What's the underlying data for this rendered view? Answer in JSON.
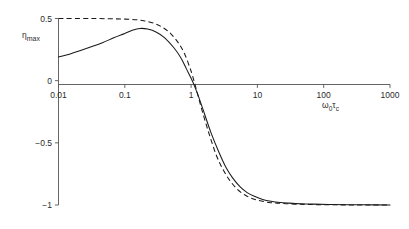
{
  "chart_data": {
    "type": "line",
    "title": "",
    "subtitle": "",
    "xlabel": "ω₀τc",
    "xlabel_main": "ω",
    "xlabel_sub1": "0",
    "xlabel_mid": "τ",
    "xlabel_sub2": "c",
    "ylabel": "ηmax",
    "ylabel_main": "η",
    "ylabel_sub": "max",
    "xscale": "log",
    "yscale": "linear",
    "xlim": [
      0.01,
      1000
    ],
    "ylim": [
      -1,
      0.5
    ],
    "grid": false,
    "legend": "none",
    "xticks": [
      0.01,
      0.1,
      1,
      10,
      100,
      1000
    ],
    "xtick_labels": [
      "0.01",
      "0.1",
      "1",
      "10",
      "100",
      "1000"
    ],
    "yticks": [
      0.5,
      0,
      -0.5,
      -1
    ],
    "ytick_labels": [
      "0.5",
      "0",
      "−0.5",
      "−1"
    ],
    "zero_line": true,
    "series": [
      {
        "name": "solid",
        "style": "solid",
        "color": "#1a1a1a",
        "x": [
          0.01,
          0.015,
          0.022,
          0.032,
          0.046,
          0.068,
          0.1,
          0.13,
          0.17,
          0.22,
          0.3,
          0.4,
          0.55,
          0.7,
          0.85,
          1.0,
          1.1,
          1.3,
          1.6,
          2.0,
          2.6,
          3.3,
          4.2,
          5.5,
          7.0,
          9.0,
          12.0,
          16.0,
          22.0,
          30.0,
          45.0,
          70.0,
          120.0,
          250.0,
          600.0,
          1000.0
        ],
        "y": [
          0.19,
          0.215,
          0.245,
          0.275,
          0.305,
          0.345,
          0.38,
          0.405,
          0.42,
          0.415,
          0.39,
          0.345,
          0.265,
          0.185,
          0.095,
          0.02,
          -0.03,
          -0.13,
          -0.27,
          -0.42,
          -0.57,
          -0.69,
          -0.78,
          -0.855,
          -0.9,
          -0.93,
          -0.955,
          -0.97,
          -0.98,
          -0.985,
          -0.99,
          -0.993,
          -0.996,
          -0.998,
          -0.999,
          -1.0
        ]
      },
      {
        "name": "dashed",
        "style": "dashed",
        "color": "#1a1a1a",
        "x": [
          0.01,
          0.03,
          0.06,
          0.1,
          0.15,
          0.2,
          0.28,
          0.38,
          0.5,
          0.65,
          0.8,
          0.95,
          1.05,
          1.2,
          1.5,
          1.9,
          2.4,
          3.0,
          3.8,
          5.0,
          6.5,
          8.5,
          11.0,
          15.0,
          20.0,
          28.0,
          40.0,
          60.0,
          100.0,
          200.0,
          450.0,
          1000.0
        ],
        "y": [
          0.5,
          0.5,
          0.498,
          0.495,
          0.49,
          0.48,
          0.46,
          0.425,
          0.375,
          0.3,
          0.215,
          0.11,
          0.04,
          -0.07,
          -0.26,
          -0.44,
          -0.6,
          -0.71,
          -0.8,
          -0.875,
          -0.92,
          -0.95,
          -0.965,
          -0.98,
          -0.985,
          -0.99,
          -0.993,
          -0.996,
          -0.998,
          -0.999,
          -1.0,
          -1.0
        ]
      }
    ]
  }
}
